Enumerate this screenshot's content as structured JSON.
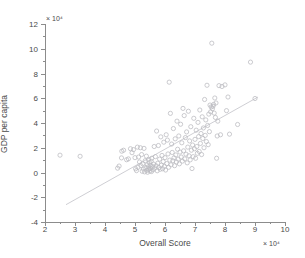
{
  "figure": {
    "background": "#ffffff",
    "axis_color": "#8c8c8c",
    "marker_color": "#b9b9bf",
    "line_color": "#c2c2c8"
  },
  "chart_data": {
    "type": "scatter",
    "title": "",
    "xlabel": "Overall Score",
    "ylabel": "GDP per capita",
    "x_exponent": "× 10⁴",
    "y_exponent": "× 10⁴",
    "xlim": [
      2,
      10
    ],
    "ylim": [
      -4,
      12
    ],
    "xticks": [
      2,
      3,
      4,
      5,
      6,
      7,
      8,
      9,
      10
    ],
    "yticks": [
      12,
      10,
      8,
      6,
      4,
      2,
      0,
      -2,
      -4
    ],
    "xticklabels": [
      "2",
      "3",
      "4",
      "5",
      "6",
      "7",
      "8",
      "9",
      "10"
    ],
    "yticklabels": [
      "12",
      "10",
      "8",
      "6",
      "4",
      "2",
      "0",
      "-2",
      "-4"
    ],
    "grid": false,
    "legend": null,
    "marker": "o",
    "marker_filled": false,
    "trendline": {
      "x": [
        2.7,
        9.1
      ],
      "y": [
        -2.6,
        6.1
      ]
    },
    "points": [
      [
        2.5,
        1.4
      ],
      [
        3.17,
        1.31
      ],
      [
        4.42,
        0.35
      ],
      [
        4.47,
        0.52
      ],
      [
        4.55,
        1.18
      ],
      [
        4.56,
        1.72
      ],
      [
        4.62,
        1.8
      ],
      [
        4.72,
        1.03
      ],
      [
        4.78,
        1.1
      ],
      [
        4.85,
        1.92
      ],
      [
        4.9,
        1.6
      ],
      [
        4.95,
        1.85
      ],
      [
        5.0,
        1.2
      ],
      [
        5.02,
        0.3
      ],
      [
        5.05,
        0.15
      ],
      [
        5.08,
        2.05
      ],
      [
        5.1,
        0.42
      ],
      [
        5.12,
        1.25
      ],
      [
        5.15,
        0.85
      ],
      [
        5.18,
        2.0
      ],
      [
        5.2,
        0.55
      ],
      [
        5.22,
        1.45
      ],
      [
        5.24,
        0.1
      ],
      [
        5.26,
        0.7
      ],
      [
        5.28,
        0.28
      ],
      [
        5.3,
        1.95
      ],
      [
        5.32,
        0.05
      ],
      [
        5.34,
        0.95
      ],
      [
        5.36,
        0.38
      ],
      [
        5.38,
        1.32
      ],
      [
        5.4,
        0.18
      ],
      [
        5.41,
        0.62
      ],
      [
        5.42,
        0.02
      ],
      [
        5.44,
        0.45
      ],
      [
        5.45,
        1.05
      ],
      [
        5.46,
        0.25
      ],
      [
        5.48,
        0.8
      ],
      [
        5.5,
        0.12
      ],
      [
        5.51,
        0.58
      ],
      [
        5.52,
        0.33
      ],
      [
        5.54,
        0.9
      ],
      [
        5.55,
        0.08
      ],
      [
        5.56,
        1.15
      ],
      [
        5.58,
        0.48
      ],
      [
        5.6,
        0.22
      ],
      [
        5.62,
        0.68
      ],
      [
        5.64,
        2.1
      ],
      [
        5.66,
        0.36
      ],
      [
        5.68,
        1.28
      ],
      [
        5.7,
        0.55
      ],
      [
        5.72,
        3.35
      ],
      [
        5.74,
        0.14
      ],
      [
        5.76,
        0.75
      ],
      [
        5.78,
        2.18
      ],
      [
        5.8,
        0.4
      ],
      [
        5.82,
        1.08
      ],
      [
        5.84,
        0.26
      ],
      [
        5.86,
        2.88
      ],
      [
        5.88,
        0.6
      ],
      [
        5.9,
        1.38
      ],
      [
        5.92,
        0.3
      ],
      [
        5.94,
        0.88
      ],
      [
        5.96,
        2.45
      ],
      [
        5.98,
        0.5
      ],
      [
        6.0,
        1.2
      ],
      [
        6.02,
        0.2
      ],
      [
        6.04,
        3.05
      ],
      [
        6.06,
        0.72
      ],
      [
        6.08,
        2.62
      ],
      [
        6.1,
        1.5
      ],
      [
        6.12,
        0.42
      ],
      [
        6.14,
        7.3
      ],
      [
        6.16,
        1.0
      ],
      [
        6.18,
        4.78
      ],
      [
        6.2,
        0.62
      ],
      [
        6.22,
        2.3
      ],
      [
        6.24,
        1.62
      ],
      [
        6.26,
        0.95
      ],
      [
        6.28,
        3.55
      ],
      [
        6.3,
        1.18
      ],
      [
        6.32,
        0.55
      ],
      [
        6.34,
        2.72
      ],
      [
        6.36,
        1.42
      ],
      [
        6.38,
        0.85
      ],
      [
        6.4,
        4.15
      ],
      [
        6.42,
        1.88
      ],
      [
        6.44,
        1.08
      ],
      [
        6.46,
        2.95
      ],
      [
        6.48,
        0.7
      ],
      [
        6.5,
        1.65
      ],
      [
        6.52,
        3.9
      ],
      [
        6.54,
        1.25
      ],
      [
        6.56,
        2.4
      ],
      [
        6.58,
        0.92
      ],
      [
        6.6,
        5.18
      ],
      [
        6.62,
        1.75
      ],
      [
        6.64,
        4.6
      ],
      [
        6.66,
        1.1
      ],
      [
        6.68,
        2.82
      ],
      [
        6.7,
        1.48
      ],
      [
        6.72,
        3.28
      ],
      [
        6.74,
        0.78
      ],
      [
        6.76,
        2.05
      ],
      [
        6.78,
        4.95
      ],
      [
        6.8,
        1.35
      ],
      [
        6.82,
        2.55
      ],
      [
        6.84,
        1.02
      ],
      [
        6.86,
        3.7
      ],
      [
        6.88,
        1.8
      ],
      [
        6.9,
        0.32
      ],
      [
        6.92,
        2.22
      ],
      [
        6.94,
        1.28
      ],
      [
        6.96,
        4.38
      ],
      [
        6.98,
        1.92
      ],
      [
        7.0,
        2.68
      ],
      [
        7.02,
        1.15
      ],
      [
        7.04,
        3.42
      ],
      [
        7.06,
        2.1
      ],
      [
        7.08,
        1.55
      ],
      [
        7.1,
        4.05
      ],
      [
        7.12,
        2.9
      ],
      [
        7.14,
        1.7
      ],
      [
        7.16,
        5.05
      ],
      [
        7.18,
        2.35
      ],
      [
        7.2,
        3.15
      ],
      [
        7.22,
        1.45
      ],
      [
        7.24,
        4.5
      ],
      [
        7.26,
        2.75
      ],
      [
        7.28,
        3.6
      ],
      [
        7.3,
        2.0
      ],
      [
        7.32,
        5.9
      ],
      [
        7.34,
        3.0
      ],
      [
        7.36,
        4.25
      ],
      [
        7.38,
        2.5
      ],
      [
        7.4,
        7.05
      ],
      [
        7.42,
        3.8
      ],
      [
        7.44,
        2.25
      ],
      [
        7.46,
        4.72
      ],
      [
        7.48,
        3.3
      ],
      [
        7.5,
        5.45
      ],
      [
        7.52,
        4.9
      ],
      [
        7.54,
        5.3
      ],
      [
        7.56,
        10.45
      ],
      [
        7.58,
        5.15
      ],
      [
        7.6,
        5.35
      ],
      [
        7.62,
        5.5
      ],
      [
        7.64,
        4.8
      ],
      [
        7.66,
        6.02
      ],
      [
        7.68,
        4.45
      ],
      [
        7.7,
        5.62
      ],
      [
        7.72,
        1.15
      ],
      [
        7.74,
        2.95
      ],
      [
        7.76,
        4.15
      ],
      [
        7.8,
        7.02
      ],
      [
        7.85,
        3.05
      ],
      [
        7.9,
        6.95
      ],
      [
        8.0,
        7.08
      ],
      [
        8.05,
        5.0
      ],
      [
        8.1,
        6.1
      ],
      [
        8.15,
        3.1
      ],
      [
        8.42,
        3.88
      ],
      [
        8.85,
        8.92
      ],
      [
        9.0,
        5.98
      ]
    ]
  }
}
